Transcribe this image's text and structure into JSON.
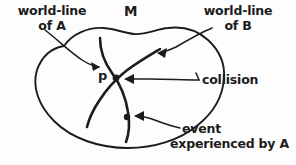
{
  "figure": {
    "kind": "spacetime-manifold-diagram",
    "width": 296,
    "height": 165,
    "background_color": "#fdfdfd",
    "ink_color": "#1c1c1c"
  },
  "labels": {
    "worldline_a": "world-line\nof A",
    "worldline_b": "world-line\nof B",
    "manifold": "M",
    "point_p": "p",
    "collision": "collision",
    "event_line1": "event",
    "event_line2": "experienced by A"
  },
  "annotations": [
    {
      "name": "world-line-of-A",
      "text": "world-line of A",
      "points_to": "left world-line curve inside manifold"
    },
    {
      "name": "world-line-of-B",
      "text": "world-line of B",
      "points_to": "right world-line curve inside manifold"
    },
    {
      "name": "manifold-M",
      "text": "M",
      "points_to": "closed blob region (spacetime manifold)"
    },
    {
      "name": "point-p",
      "text": "p",
      "points_to": "intersection of the two world-lines"
    },
    {
      "name": "collision",
      "text": "collision",
      "points_to": "intersection point p"
    },
    {
      "name": "event-experienced-by-A",
      "text": "event experienced by A",
      "points_to": "dot further along world-line of A"
    }
  ]
}
